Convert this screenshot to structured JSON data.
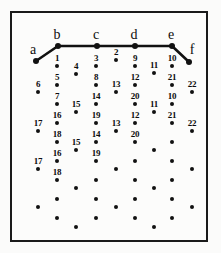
{
  "figure": {
    "title": "",
    "background_color": "#fbfbfa",
    "frame_color": "#1a1a1a",
    "point_color": "#111111",
    "polyline_color": "#111111"
  },
  "chart_data": {
    "type": "scatter",
    "title": "",
    "xlabel": "",
    "ylabel": "",
    "grid": false,
    "legend": null,
    "xlim": [
      10,
      208
    ],
    "ylim": [
      11,
      242
    ],
    "polyline": {
      "name": "upper-boundary-path",
      "vertex_labels": [
        "a",
        "b",
        "c",
        "d",
        "e",
        "f"
      ],
      "vertices": [
        {
          "label": "a",
          "x": 36,
          "y": 61
        },
        {
          "label": "b",
          "x": 58,
          "y": 46
        },
        {
          "label": "c",
          "x": 97,
          "y": 46
        },
        {
          "label": "d",
          "x": 135,
          "y": 46
        },
        {
          "label": "e",
          "x": 172,
          "y": 46
        },
        {
          "label": "f",
          "x": 189,
          "y": 62
        }
      ],
      "vertex_label_offsets": [
        {
          "label": "a",
          "x": 33,
          "y": 57
        },
        {
          "label": "b",
          "x": 57,
          "y": 42
        },
        {
          "label": "c",
          "x": 96,
          "y": 42
        },
        {
          "label": "d",
          "x": 134,
          "y": 42
        },
        {
          "label": "e",
          "x": 171,
          "y": 42
        },
        {
          "label": "f",
          "x": 192,
          "y": 57
        }
      ]
    },
    "points": [
      {
        "x": 57,
        "y": 66,
        "label": "1"
      },
      {
        "x": 116,
        "y": 60,
        "label": "2"
      },
      {
        "x": 96,
        "y": 66,
        "label": "3"
      },
      {
        "x": 76,
        "y": 74,
        "label": "4"
      },
      {
        "x": 135,
        "y": 66,
        "label": "9"
      },
      {
        "x": 172,
        "y": 66,
        "label": "10"
      },
      {
        "x": 154,
        "y": 73,
        "label": "11"
      },
      {
        "x": 57,
        "y": 85,
        "label": "5"
      },
      {
        "x": 96,
        "y": 85,
        "label": "8"
      },
      {
        "x": 135,
        "y": 85,
        "label": "12"
      },
      {
        "x": 172,
        "y": 85,
        "label": "21"
      },
      {
        "x": 38,
        "y": 92,
        "label": "6"
      },
      {
        "x": 116,
        "y": 92,
        "label": "13"
      },
      {
        "x": 192,
        "y": 92,
        "label": "22"
      },
      {
        "x": 57,
        "y": 104,
        "label": "7"
      },
      {
        "x": 96,
        "y": 104,
        "label": "14"
      },
      {
        "x": 135,
        "y": 104,
        "label": "20"
      },
      {
        "x": 172,
        "y": 104,
        "label": "10"
      },
      {
        "x": 76,
        "y": 112,
        "label": "15"
      },
      {
        "x": 154,
        "y": 112,
        "label": "11"
      },
      {
        "x": 57,
        "y": 123,
        "label": "16"
      },
      {
        "x": 96,
        "y": 123,
        "label": "19"
      },
      {
        "x": 135,
        "y": 123,
        "label": "12"
      },
      {
        "x": 172,
        "y": 123,
        "label": "21"
      },
      {
        "x": 38,
        "y": 131,
        "label": "17"
      },
      {
        "x": 116,
        "y": 131,
        "label": "13"
      },
      {
        "x": 192,
        "y": 131,
        "label": "22"
      },
      {
        "x": 57,
        "y": 142,
        "label": "18"
      },
      {
        "x": 96,
        "y": 142,
        "label": "14"
      },
      {
        "x": 135,
        "y": 142,
        "label": "20"
      },
      {
        "x": 172,
        "y": 142,
        "label": ""
      },
      {
        "x": 76,
        "y": 150,
        "label": "15"
      },
      {
        "x": 154,
        "y": 150,
        "label": ""
      },
      {
        "x": 57,
        "y": 161,
        "label": "16"
      },
      {
        "x": 96,
        "y": 161,
        "label": "19"
      },
      {
        "x": 135,
        "y": 161,
        "label": ""
      },
      {
        "x": 172,
        "y": 161,
        "label": ""
      },
      {
        "x": 38,
        "y": 169,
        "label": "17"
      },
      {
        "x": 116,
        "y": 169,
        "label": ""
      },
      {
        "x": 192,
        "y": 169,
        "label": ""
      },
      {
        "x": 57,
        "y": 180,
        "label": "18"
      },
      {
        "x": 96,
        "y": 180,
        "label": ""
      },
      {
        "x": 135,
        "y": 180,
        "label": ""
      },
      {
        "x": 172,
        "y": 180,
        "label": ""
      },
      {
        "x": 76,
        "y": 188,
        "label": ""
      },
      {
        "x": 154,
        "y": 188,
        "label": ""
      },
      {
        "x": 57,
        "y": 199,
        "label": ""
      },
      {
        "x": 96,
        "y": 199,
        "label": ""
      },
      {
        "x": 135,
        "y": 199,
        "label": ""
      },
      {
        "x": 172,
        "y": 199,
        "label": ""
      },
      {
        "x": 38,
        "y": 207,
        "label": ""
      },
      {
        "x": 116,
        "y": 207,
        "label": ""
      },
      {
        "x": 192,
        "y": 207,
        "label": ""
      },
      {
        "x": 57,
        "y": 218,
        "label": ""
      },
      {
        "x": 96,
        "y": 218,
        "label": ""
      },
      {
        "x": 135,
        "y": 218,
        "label": ""
      },
      {
        "x": 172,
        "y": 218,
        "label": ""
      },
      {
        "x": 76,
        "y": 227,
        "label": ""
      },
      {
        "x": 154,
        "y": 227,
        "label": ""
      }
    ]
  }
}
